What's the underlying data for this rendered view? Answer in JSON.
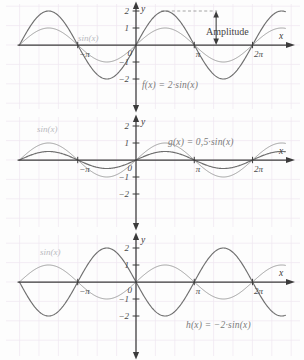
{
  "figure": {
    "background_color": "#fdfdfd",
    "grid_color": "#efe7f0",
    "axis_color": "#3b3b3b",
    "curve_color": "#6f6f6f",
    "reference_curve_color": "#9a9a9a",
    "label_color": "#7a7a7a"
  },
  "chart_data": [
    {
      "type": "line",
      "panel": 1,
      "title": "f(x) = 2·sin(x)",
      "xlabel": "x",
      "ylabel": "y",
      "xlim": [
        -6.283185,
        7.5398
      ],
      "ylim": [
        -2.6,
        2.6
      ],
      "grid": true,
      "x_ticks": [
        -3.141593,
        0,
        3.141593,
        6.283185
      ],
      "x_tick_labels": [
        "−π",
        "0",
        "π",
        "2π"
      ],
      "y_ticks": [
        -2,
        -1,
        1,
        2
      ],
      "y_tick_labels": [
        "−2",
        "−1",
        "1",
        "2"
      ],
      "series": [
        {
          "name": "sin(x)",
          "label": "sin(x)",
          "amplitude": 1,
          "formula": "sin(x)",
          "color": "#9a9a9a",
          "annotation_x": -2.3,
          "annotation_y": 0.62
        },
        {
          "name": "f",
          "label": "f(x) = 2·sin(x)",
          "amplitude": 2,
          "formula": "2*sin(x)",
          "color": "#6f6f6f"
        }
      ],
      "annotations": [
        {
          "name": "amplitude",
          "text": "Amplitude",
          "type": "double-arrow",
          "from_y": 2,
          "to_y": 0,
          "at_x": 4.32,
          "guide_line_y": 2
        }
      ]
    },
    {
      "type": "line",
      "panel": 2,
      "title": "g(x) = 0,5·sin(x)",
      "xlabel": "x",
      "ylabel": "y",
      "xlim": [
        -6.283185,
        7.5398
      ],
      "ylim": [
        -2.6,
        2.6
      ],
      "grid": true,
      "x_ticks": [
        -3.141593,
        0,
        3.141593,
        6.283185
      ],
      "x_tick_labels": [
        "−π",
        "0",
        "π",
        "2π"
      ],
      "y_ticks": [
        -2,
        -1,
        1,
        2
      ],
      "y_tick_labels": [
        "−2",
        "−1",
        "1",
        "2"
      ],
      "series": [
        {
          "name": "sin(x)",
          "label": "sin(x)",
          "amplitude": 1,
          "formula": "sin(x)",
          "color": "#9a9a9a",
          "annotation_x": -3.6,
          "annotation_y": 1.55
        },
        {
          "name": "g",
          "label": "g(x) = 0,5·sin(x)",
          "amplitude": 0.5,
          "formula": "0.5*sin(x)",
          "color": "#6f6f6f"
        }
      ],
      "annotations": []
    },
    {
      "type": "line",
      "panel": 3,
      "title": "h(x) = −2·sin(x)",
      "xlabel": "x",
      "ylabel": "y",
      "xlim": [
        -6.283185,
        7.5398
      ],
      "ylim": [
        -2.6,
        2.6
      ],
      "grid": true,
      "x_ticks": [
        -3.141593,
        0,
        3.141593,
        6.283185
      ],
      "x_tick_labels": [
        "−π",
        "0",
        "π",
        "2π"
      ],
      "y_ticks": [
        -2,
        -1,
        1,
        2
      ],
      "y_tick_labels": [
        "−2",
        "−1",
        "1",
        "2"
      ],
      "series": [
        {
          "name": "sin(x)",
          "label": "sin(x)",
          "amplitude": 1,
          "formula": "sin(x)",
          "color": "#9a9a9a",
          "annotation_x": -3.6,
          "annotation_y": 1.55
        },
        {
          "name": "h",
          "label": "h(x) = −2·sin(x)",
          "amplitude": -2,
          "formula": "-2*sin(x)",
          "color": "#6f6f6f"
        }
      ],
      "annotations": []
    }
  ],
  "panels": [
    {
      "id": "panel-1",
      "function_label": "f(x) = 2·sin(x)",
      "reference_label": "sin(x)",
      "amplitude_label": "Amplitude",
      "x_axis_label": "x",
      "y_axis_label": "y",
      "origin_label": "0",
      "x_tick_labels": [
        "−π",
        "π",
        "2π"
      ],
      "y_tick_labels": [
        "2",
        "1",
        "−1",
        "−2"
      ]
    },
    {
      "id": "panel-2",
      "function_label": "g(x) = 0,5·sin(x)",
      "reference_label": "sin(x)",
      "x_axis_label": "x",
      "y_axis_label": "y",
      "origin_label": "0",
      "x_tick_labels": [
        "−π",
        "π",
        "2π"
      ],
      "y_tick_labels": [
        "2",
        "1",
        "−1",
        "−2"
      ]
    },
    {
      "id": "panel-3",
      "function_label": "h(x) = −2·sin(x)",
      "reference_label": "sin(x)",
      "x_axis_label": "x",
      "y_axis_label": "y",
      "origin_label": "0",
      "x_tick_labels": [
        "−π",
        "π",
        "2π"
      ],
      "y_tick_labels": [
        "2",
        "1",
        "−1",
        "−2"
      ]
    }
  ]
}
